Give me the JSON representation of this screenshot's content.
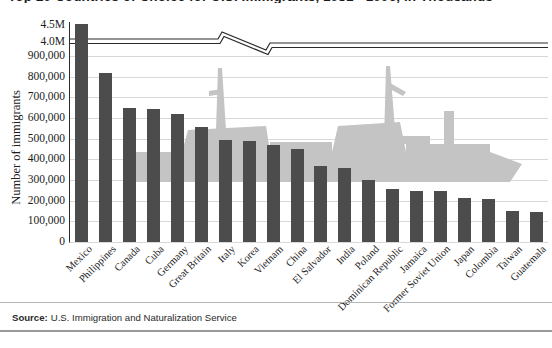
{
  "title": "Top 20 Countries of Choice for U.S. Immigrants, 1981 - 1996, in Thousands",
  "source": {
    "label": "Source:",
    "text": "U.S. Immigration and Naturalization Service"
  },
  "axes": {
    "y_title": "Number of immigrants",
    "upper_ticks": [
      "4.5M",
      "4.0M"
    ],
    "lower_ticks": [
      "900,000",
      "800,000",
      "700,000",
      "600,000",
      "500,000",
      "400,000",
      "300,000",
      "200,000",
      "100,000",
      "0"
    ]
  },
  "colors": {
    "bar": "#4c4c4c",
    "gridline": "#d8d8d8",
    "axis": "#2b2b2b",
    "watermark": "#c2c2c2",
    "background": "#ffffff"
  },
  "chart_data": {
    "type": "bar",
    "title": "Top 20 Countries of Choice for U.S. Immigrants, 1981 - 1996, in Thousands",
    "xlabel": "",
    "ylabel": "Number of immigrants",
    "ylim": [
      0,
      900000
    ],
    "y_break": {
      "present": true,
      "break_above": 900000,
      "upper_range": [
        4000000,
        4500000
      ],
      "upper_tick_values": [
        4000000,
        4500000
      ]
    },
    "grid": true,
    "legend": "none",
    "ytick_values": [
      0,
      100000,
      200000,
      300000,
      400000,
      500000,
      600000,
      700000,
      800000,
      900000
    ],
    "categories": [
      "Mexico",
      "Philippines",
      "Canada",
      "Cuba",
      "Germany",
      "Great Britain",
      "Italy",
      "Korea",
      "Vietnam",
      "China",
      "El Salvador",
      "India",
      "Poland",
      "Dominican Republic",
      "Jamaica",
      "Former Soviet Union",
      "Japan",
      "Colombia",
      "Taiwan",
      "Guatemala"
    ],
    "values": [
      4300000,
      820000,
      650000,
      645000,
      620000,
      555000,
      495000,
      490000,
      470000,
      450000,
      370000,
      360000,
      300000,
      255000,
      245000,
      245000,
      215000,
      210000,
      150000,
      145000
    ],
    "value_labels": [
      "4,300,000",
      "820,000",
      "650,000",
      "645,000",
      "620,000",
      "555,000",
      "495,000",
      "490,000",
      "470,000",
      "450,000",
      "370,000",
      "360,000",
      "300,000",
      "255,000",
      "245,000",
      "245,000",
      "215,000",
      "210,000",
      "150,000",
      "145,000"
    ],
    "annotations": [
      "Mexico bar extends past the broken axis into the 4.0M-4.5M band",
      "Decorative ocean-liner / ship silhouette watermark behind the bars"
    ]
  }
}
